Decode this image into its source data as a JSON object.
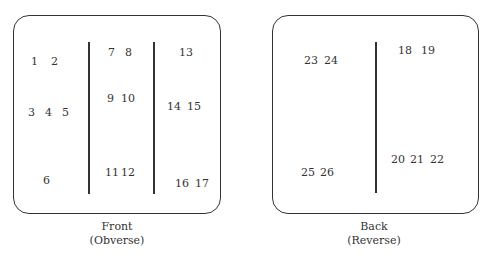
{
  "front": {
    "caption_line1": "Front",
    "caption_line2": "(Obverse)",
    "labels": [
      "1",
      "2",
      "3",
      "4",
      "5",
      "6",
      "7",
      "8",
      "9",
      "10",
      "11",
      "12",
      "13",
      "14",
      "15",
      "16",
      "17"
    ]
  },
  "back": {
    "caption_line1": "Back",
    "caption_line2": "(Reverse)",
    "labels": [
      "18",
      "19",
      "20",
      "21",
      "22",
      "23",
      "24",
      "25",
      "26"
    ]
  }
}
